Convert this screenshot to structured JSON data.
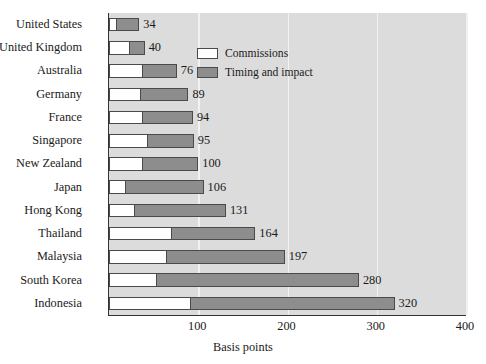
{
  "chart_data": {
    "type": "bar",
    "orientation": "horizontal",
    "stacked": true,
    "title": "",
    "xlabel": "Basis points",
    "ylabel": "",
    "xlim": [
      0,
      400
    ],
    "xticks": [
      100,
      200,
      300,
      400
    ],
    "grid": true,
    "legend_position": "top-right-inside",
    "categories": [
      "United States",
      "United Kingdom",
      "Australia",
      "Germany",
      "France",
      "Singapore",
      "New Zealand",
      "Japan",
      "Hong Kong",
      "Thailand",
      "Malaysia",
      "South Korea",
      "Indonesia"
    ],
    "totals": [
      34,
      40,
      76,
      89,
      94,
      95,
      100,
      106,
      131,
      164,
      197,
      280,
      320
    ],
    "data_labels": [
      "34",
      "40",
      "76",
      "89",
      "94",
      "95",
      "100",
      "106",
      "131",
      "164",
      "197",
      "280",
      "320"
    ],
    "series": [
      {
        "name": "Commissions",
        "color": "#ffffff",
        "values": [
          9,
          24,
          38,
          36,
          38,
          44,
          38,
          19,
          29,
          71,
          65,
          54,
          92
        ]
      },
      {
        "name": "Timing and impact",
        "color": "#8d8d8d",
        "values": [
          25,
          16,
          38,
          53,
          56,
          51,
          62,
          87,
          102,
          93,
          132,
          226,
          228
        ]
      }
    ]
  },
  "legend": {
    "items": [
      {
        "label": "Commissions",
        "swatch": "commissions"
      },
      {
        "label": "Timing and impact",
        "swatch": "timing"
      }
    ]
  },
  "axis": {
    "xlabel": "Basis points",
    "ticks": [
      "100",
      "200",
      "300",
      "400"
    ]
  },
  "colors": {
    "plot_background": "#dcdcdc",
    "gridline": "#f2f2f2",
    "bar_commissions": "#ffffff",
    "bar_timing": "#8d8d8d",
    "bar_outline": "#4a4a4a",
    "axis": "#333333",
    "text": "#1a1a1a"
  }
}
